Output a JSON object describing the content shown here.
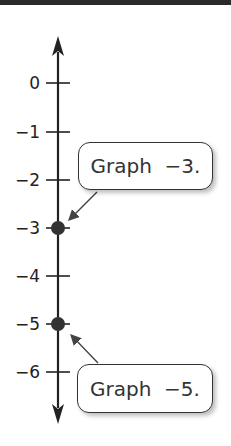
{
  "diagram": {
    "type": "vertical number line",
    "ticks": [
      {
        "value": 0,
        "label": "0"
      },
      {
        "value": -1,
        "label": "−1"
      },
      {
        "value": -2,
        "label": "−2"
      },
      {
        "value": -3,
        "label": "−3"
      },
      {
        "value": -4,
        "label": "−4"
      },
      {
        "value": -5,
        "label": "−5"
      },
      {
        "value": -6,
        "label": "−6"
      }
    ],
    "points": [
      -3,
      -5
    ],
    "callouts": [
      {
        "text": "Graph  −3.",
        "points_to": -3
      },
      {
        "text": "Graph  −5.",
        "points_to": -5
      }
    ],
    "colors": {
      "line": "#222222",
      "point": "#333333",
      "callout_border": "#333333"
    }
  }
}
